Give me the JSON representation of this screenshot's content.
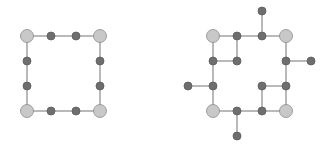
{
  "colors": {
    "background": "#ffffff",
    "edge": "#8a8a8a",
    "large_fill": "#c8c8c8",
    "large_stroke": "#8c8c8c",
    "small_fill": "#6e6e6e",
    "small_stroke": "#5c5c5c"
  },
  "sizes": {
    "large_r": 6.5,
    "small_r": 4
  },
  "graphs": [
    {
      "name": "left-graph",
      "nodes": [
        {
          "id": "A",
          "x": 27,
          "y": 36,
          "type": "large"
        },
        {
          "id": "B",
          "x": 100,
          "y": 36,
          "type": "large"
        },
        {
          "id": "C",
          "x": 27,
          "y": 111,
          "type": "large"
        },
        {
          "id": "D",
          "x": 100,
          "y": 111,
          "type": "large"
        },
        {
          "id": "t1",
          "x": 51,
          "y": 36,
          "type": "small"
        },
        {
          "id": "t2",
          "x": 76,
          "y": 36,
          "type": "small"
        },
        {
          "id": "b1",
          "x": 51,
          "y": 111,
          "type": "small"
        },
        {
          "id": "b2",
          "x": 76,
          "y": 111,
          "type": "small"
        },
        {
          "id": "l1",
          "x": 27,
          "y": 61,
          "type": "small"
        },
        {
          "id": "l2",
          "x": 27,
          "y": 86,
          "type": "small"
        },
        {
          "id": "r1",
          "x": 100,
          "y": 61,
          "type": "small"
        },
        {
          "id": "r2",
          "x": 100,
          "y": 86,
          "type": "small"
        }
      ],
      "edges": [
        [
          "A",
          "t1"
        ],
        [
          "t1",
          "t2"
        ],
        [
          "t2",
          "B"
        ],
        [
          "C",
          "b1"
        ],
        [
          "b1",
          "b2"
        ],
        [
          "b2",
          "D"
        ],
        [
          "A",
          "l1"
        ],
        [
          "l1",
          "l2"
        ],
        [
          "l2",
          "C"
        ],
        [
          "B",
          "r1"
        ],
        [
          "r1",
          "r2"
        ],
        [
          "r2",
          "D"
        ]
      ]
    },
    {
      "name": "right-graph",
      "nodes": [
        {
          "id": "A",
          "x": 213,
          "y": 36,
          "type": "large"
        },
        {
          "id": "B",
          "x": 286,
          "y": 36,
          "type": "large"
        },
        {
          "id": "C",
          "x": 213,
          "y": 111,
          "type": "large"
        },
        {
          "id": "D",
          "x": 286,
          "y": 111,
          "type": "large"
        },
        {
          "id": "t1",
          "x": 237,
          "y": 36,
          "type": "small"
        },
        {
          "id": "t2",
          "x": 262,
          "y": 36,
          "type": "small"
        },
        {
          "id": "b1",
          "x": 237,
          "y": 111,
          "type": "small"
        },
        {
          "id": "b2",
          "x": 262,
          "y": 111,
          "type": "small"
        },
        {
          "id": "l1",
          "x": 213,
          "y": 61,
          "type": "small"
        },
        {
          "id": "l2",
          "x": 213,
          "y": 86,
          "type": "small"
        },
        {
          "id": "r1",
          "x": 286,
          "y": 61,
          "type": "small"
        },
        {
          "id": "r2",
          "x": 286,
          "y": 86,
          "type": "small"
        },
        {
          "id": "in1",
          "x": 237,
          "y": 61,
          "type": "small"
        },
        {
          "id": "in2",
          "x": 262,
          "y": 86,
          "type": "small"
        },
        {
          "id": "top",
          "x": 262,
          "y": 11,
          "type": "small"
        },
        {
          "id": "right",
          "x": 311,
          "y": 61,
          "type": "small"
        },
        {
          "id": "left",
          "x": 188,
          "y": 86,
          "type": "small"
        },
        {
          "id": "bottom",
          "x": 237,
          "y": 136,
          "type": "small"
        }
      ],
      "edges": [
        [
          "A",
          "t1"
        ],
        [
          "t1",
          "t2"
        ],
        [
          "t2",
          "B"
        ],
        [
          "C",
          "b1"
        ],
        [
          "b1",
          "b2"
        ],
        [
          "b2",
          "D"
        ],
        [
          "A",
          "l1"
        ],
        [
          "l1",
          "l2"
        ],
        [
          "l2",
          "C"
        ],
        [
          "B",
          "r1"
        ],
        [
          "r1",
          "r2"
        ],
        [
          "r2",
          "D"
        ],
        [
          "t1",
          "in1"
        ],
        [
          "l1",
          "in1"
        ],
        [
          "r2",
          "in2"
        ],
        [
          "b2",
          "in2"
        ],
        [
          "t2",
          "top"
        ],
        [
          "r1",
          "right"
        ],
        [
          "l2",
          "left"
        ],
        [
          "b1",
          "bottom"
        ]
      ]
    }
  ]
}
